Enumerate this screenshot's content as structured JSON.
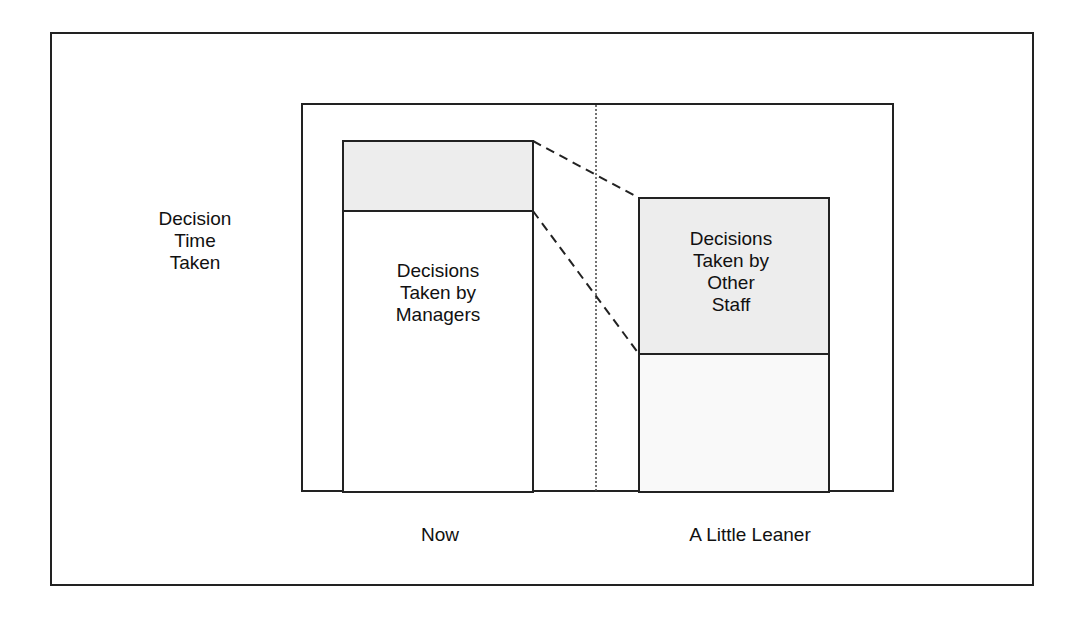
{
  "diagram": {
    "y_axis_label": [
      "Decision",
      "Time",
      "Taken"
    ],
    "categories": [
      "Now",
      "A Little Leaner"
    ],
    "bars": [
      {
        "category": "Now",
        "segments": [
          {
            "name": "Decisions Taken by Other Staff",
            "label": "",
            "fill": "#ededed",
            "relative_height": 70
          },
          {
            "name": "Decisions Taken by Managers",
            "label": [
              "Decisions",
              "Taken by",
              "Managers"
            ],
            "fill": "#ffffff",
            "relative_height": 281
          }
        ]
      },
      {
        "category": "A Little Leaner",
        "segments": [
          {
            "name": "Decisions Taken by Other Staff",
            "label": [
              "Decisions",
              "Taken by",
              "Other",
              "Staff"
            ],
            "fill": "#ededed",
            "relative_height": 156
          },
          {
            "name": "Decisions Taken by Managers",
            "label": "",
            "fill": "#ffffff",
            "relative_height": 140
          }
        ]
      }
    ],
    "connectors": "dashed lines linking segment boundaries between bars",
    "separator": "dotted vertical line between categories"
  },
  "colors": {
    "line": "#222222",
    "shade": "#ededed",
    "background": "#ffffff"
  }
}
